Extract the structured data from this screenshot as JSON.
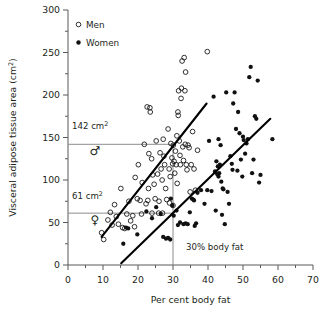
{
  "chart_data": {
    "type": "scatter",
    "title": "",
    "xlabel": "Per cent body fat",
    "ylabel": "Visceral adipose tissue area (cm²)",
    "xlim": [
      0,
      70
    ],
    "ylim": [
      0,
      300
    ],
    "xticks": [
      0,
      10,
      20,
      30,
      40,
      50,
      60,
      70
    ],
    "yticks": [
      0,
      50,
      100,
      150,
      200,
      250,
      300
    ],
    "xtick_labels": [
      "0",
      "10",
      "20",
      "30",
      "40",
      "50",
      "60",
      "70"
    ],
    "ytick_labels": [
      "0",
      "50",
      "100",
      "150",
      "200",
      "250",
      "300"
    ],
    "xminor_step": 5,
    "yminor_step": 25,
    "grid": false,
    "legend_position": "top-left",
    "legend": [
      {
        "name": "Men",
        "marker": "open-circle"
      },
      {
        "name": "Women",
        "marker": "filled-circle"
      }
    ],
    "series": [
      {
        "name": "Men",
        "marker": "open-circle",
        "points": [
          [
            10.2,
            30
          ],
          [
            9.6,
            38
          ],
          [
            11.4,
            53
          ],
          [
            12.1,
            62
          ],
          [
            12.6,
            47
          ],
          [
            13.3,
            71
          ],
          [
            13.8,
            57
          ],
          [
            14.4,
            48
          ],
          [
            15.1,
            90
          ],
          [
            15.6,
            44
          ],
          [
            16.2,
            43
          ],
          [
            16.8,
            60
          ],
          [
            17.4,
            75
          ],
          [
            17.9,
            52
          ],
          [
            18.5,
            58
          ],
          [
            19.2,
            103
          ],
          [
            19.8,
            78
          ],
          [
            20.1,
            118
          ],
          [
            20.6,
            76
          ],
          [
            21.2,
            97
          ],
          [
            21.8,
            142
          ],
          [
            22.3,
            72
          ],
          [
            22.8,
            76
          ],
          [
            23.1,
            131
          ],
          [
            23.4,
            185
          ],
          [
            23.5,
            180
          ],
          [
            23.9,
            125
          ],
          [
            24.2,
            106
          ],
          [
            24.6,
            95
          ],
          [
            24.9,
            78
          ],
          [
            25.2,
            146
          ],
          [
            25.6,
            107
          ],
          [
            25.9,
            61
          ],
          [
            26.3,
            132
          ],
          [
            26.6,
            113
          ],
          [
            26.9,
            100
          ],
          [
            27.2,
            148
          ],
          [
            27.4,
            128
          ],
          [
            27.6,
            118
          ],
          [
            27.9,
            90
          ],
          [
            28.2,
            77
          ],
          [
            28.6,
            160
          ],
          [
            28.9,
            113
          ],
          [
            29.2,
            104
          ],
          [
            29.4,
            143
          ],
          [
            29.7,
            126
          ],
          [
            29.9,
            119
          ],
          [
            30.1,
            141
          ],
          [
            30.3,
            122
          ],
          [
            30.5,
            108
          ],
          [
            30.7,
            134
          ],
          [
            30.9,
            118
          ],
          [
            31.1,
            152
          ],
          [
            31.2,
            96
          ],
          [
            31.4,
            180
          ],
          [
            31.5,
            176
          ],
          [
            31.6,
            205
          ],
          [
            31.8,
            146
          ],
          [
            32.0,
            129
          ],
          [
            32.1,
            118
          ],
          [
            32.3,
            196
          ],
          [
            32.4,
            208
          ],
          [
            32.6,
            240
          ],
          [
            32.8,
            139
          ],
          [
            33.0,
            123
          ],
          [
            33.2,
            244
          ],
          [
            33.4,
            205
          ],
          [
            33.6,
            227
          ],
          [
            33.8,
            118
          ],
          [
            34.0,
            112
          ],
          [
            34.3,
            141
          ],
          [
            34.6,
            138
          ],
          [
            34.9,
            86
          ],
          [
            35.2,
            118
          ],
          [
            35.6,
            157
          ],
          [
            36.0,
            113
          ],
          [
            36.4,
            88
          ],
          [
            37.0,
            135
          ],
          [
            39.8,
            251
          ],
          [
            22.6,
            186
          ],
          [
            29.0,
            73
          ],
          [
            30.0,
            70
          ],
          [
            23.0,
            90
          ],
          [
            19.0,
            45
          ],
          [
            27.0,
            61
          ],
          [
            21.0,
            60
          ],
          [
            24.0,
            61
          ],
          [
            26.0,
            75
          ],
          [
            33.5,
            142
          ]
        ]
      },
      {
        "name": "Women",
        "marker": "filled-circle",
        "points": [
          [
            15.8,
            25
          ],
          [
            16.6,
            44
          ],
          [
            17.2,
            43
          ],
          [
            19.8,
            36
          ],
          [
            22.4,
            63
          ],
          [
            24.0,
            55
          ],
          [
            25.2,
            68
          ],
          [
            26.5,
            60
          ],
          [
            27.2,
            33
          ],
          [
            28.0,
            31
          ],
          [
            28.6,
            32
          ],
          [
            29.2,
            30
          ],
          [
            29.4,
            78
          ],
          [
            29.8,
            70
          ],
          [
            30.2,
            58
          ],
          [
            31.4,
            47
          ],
          [
            32.0,
            50
          ],
          [
            33.0,
            48
          ],
          [
            33.6,
            49
          ],
          [
            34.2,
            48
          ],
          [
            34.8,
            62
          ],
          [
            35.4,
            78
          ],
          [
            35.8,
            77
          ],
          [
            36.2,
            46
          ],
          [
            36.6,
            49
          ],
          [
            37.0,
            85
          ],
          [
            38.0,
            88
          ],
          [
            39.0,
            72
          ],
          [
            39.8,
            88
          ],
          [
            40.3,
            146
          ],
          [
            41.0,
            87
          ],
          [
            41.6,
            198
          ],
          [
            42.0,
            110
          ],
          [
            42.2,
            64
          ],
          [
            42.4,
            122
          ],
          [
            42.6,
            107
          ],
          [
            42.8,
            116
          ],
          [
            43.0,
            104
          ],
          [
            43.2,
            108
          ],
          [
            43.4,
            118
          ],
          [
            43.6,
            141
          ],
          [
            43.8,
            98
          ],
          [
            44.0,
            59
          ],
          [
            44.4,
            89
          ],
          [
            44.8,
            48
          ],
          [
            45.2,
            203
          ],
          [
            45.6,
            86
          ],
          [
            46.0,
            72
          ],
          [
            46.4,
            128
          ],
          [
            46.8,
            119
          ],
          [
            47.2,
            190
          ],
          [
            47.6,
            203
          ],
          [
            48.0,
            160
          ],
          [
            48.4,
            111
          ],
          [
            48.6,
            180
          ],
          [
            49.0,
            155
          ],
          [
            49.4,
            124
          ],
          [
            49.8,
            104
          ],
          [
            50.2,
            147
          ],
          [
            50.6,
            131
          ],
          [
            51.0,
            143
          ],
          [
            51.4,
            148
          ],
          [
            51.8,
            221
          ],
          [
            52.2,
            233
          ],
          [
            52.6,
            108
          ],
          [
            53.0,
            124
          ],
          [
            53.4,
            175
          ],
          [
            53.8,
            172
          ],
          [
            54.2,
            217
          ],
          [
            54.6,
            97
          ],
          [
            55.0,
            106
          ],
          [
            58.4,
            148
          ],
          [
            44.2,
            90
          ],
          [
            47.0,
            112
          ],
          [
            50.0,
            151
          ],
          [
            43.0,
            148
          ],
          [
            36.0,
            76
          ],
          [
            31.0,
            64
          ]
        ]
      }
    ],
    "fit_lines": [
      {
        "series": "Men",
        "x0": 9.6,
        "y0": 33,
        "x1": 39.6,
        "y1": 190
      },
      {
        "series": "Women",
        "x0": 15.2,
        "y0": 2,
        "x1": 57.8,
        "y1": 172
      }
    ],
    "reference_lines": [
      {
        "orientation": "horizontal",
        "value": 142,
        "label": "142 cm²",
        "symbol": "♂",
        "symbol_name": "male-symbol",
        "x_from": 0,
        "x_to": 30
      },
      {
        "orientation": "horizontal",
        "value": 61,
        "label": "61 cm²",
        "symbol": "♀",
        "symbol_name": "female-symbol",
        "x_from": 0,
        "x_to": 30
      },
      {
        "orientation": "vertical",
        "value": 30,
        "label": "30% body fat",
        "y_from": 0,
        "y_to": 142
      }
    ],
    "annotations": [
      {
        "text": "142 cm²",
        "base": "142",
        "sup": "2",
        "unit": "cm"
      },
      {
        "text": "61 cm²",
        "base": "61",
        "sup": "2",
        "unit": "cm"
      },
      {
        "text": "30% body fat"
      }
    ],
    "colors": {
      "axis": "#58595b",
      "reference": "#8c8c8c",
      "fit": "#000000",
      "men_marker": "#1a1a1a",
      "women_marker": "#111111",
      "text": "#231f20",
      "background": "#ffffff"
    }
  },
  "labels": {
    "ylabel_base": "Visceral adipose tissue area (cm",
    "ylabel_sup": "2",
    "ylabel_tail": ")",
    "xlabel": "Per cent body fat",
    "ref_142_base": "142 cm",
    "ref_142_sup": "2",
    "ref_61_base": "61 cm",
    "ref_61_sup": "2",
    "vline_label": "30% body fat",
    "legend_men": "Men",
    "legend_women": "Women",
    "male_symbol": "♂",
    "female_symbol": "♀"
  }
}
